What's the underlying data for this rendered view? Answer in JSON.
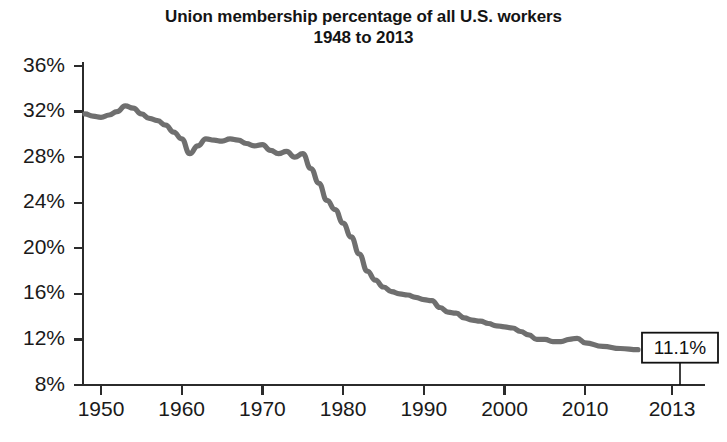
{
  "chart": {
    "title_line1": "Union membership percentage of all U.S. workers",
    "title_line2": "1948 to 2013",
    "callout_label": "11.1%",
    "line_color": "#6f6f6f",
    "axis_color": "#2b2b2b",
    "background_color": "#ffffff"
  },
  "chart_data": {
    "type": "line",
    "title": "Union membership percentage of all U.S. workers 1948 to 2013",
    "subtitle": "1948 to 2013",
    "xlabel": "",
    "ylabel": "",
    "xlim": [
      1948,
      2013
    ],
    "ylim": [
      8,
      36
    ],
    "grid": false,
    "legend": false,
    "ytick_labels": [
      "36%",
      "32%",
      "28%",
      "24%",
      "20%",
      "16%",
      "12%",
      "8%"
    ],
    "ytick_values": [
      36,
      32,
      28,
      24,
      20,
      16,
      12,
      8
    ],
    "xtick_labels": [
      "1950",
      "1960",
      "1970",
      "1980",
      "1990",
      "2000",
      "2010",
      "2013"
    ],
    "xtick_values": [
      1950,
      1960,
      1970,
      1980,
      1990,
      2000,
      2010,
      2013
    ],
    "annotations": [
      {
        "text": "11.1%",
        "x": 2013,
        "y": 11.1
      }
    ],
    "series": [
      {
        "name": "Union membership percentage",
        "x": [
          1948,
          1949,
          1950,
          1951,
          1952,
          1953,
          1954,
          1955,
          1956,
          1957,
          1958,
          1959,
          1960,
          1961,
          1962,
          1963,
          1964,
          1965,
          1966,
          1967,
          1968,
          1969,
          1970,
          1971,
          1972,
          1973,
          1974,
          1975,
          1976,
          1977,
          1978,
          1979,
          1980,
          1981,
          1982,
          1983,
          1984,
          1985,
          1986,
          1987,
          1988,
          1989,
          1990,
          1991,
          1992,
          1993,
          1994,
          1995,
          1996,
          1997,
          1998,
          1999,
          2000,
          2001,
          2002,
          2003,
          2004,
          2005,
          2006,
          2007,
          2008,
          2009,
          2010,
          2011,
          2012,
          2013
        ],
        "y": [
          31.8,
          31.6,
          31.5,
          31.7,
          32.0,
          32.5,
          32.3,
          31.8,
          31.4,
          31.2,
          30.8,
          30.2,
          29.6,
          28.3,
          29.0,
          29.6,
          29.5,
          29.4,
          29.6,
          29.5,
          29.2,
          29.0,
          29.1,
          28.6,
          28.3,
          28.5,
          28.0,
          28.3,
          27.0,
          25.7,
          24.2,
          23.4,
          22.2,
          21.0,
          19.5,
          18.0,
          17.2,
          16.6,
          16.2,
          16.0,
          15.9,
          15.7,
          15.5,
          15.4,
          14.8,
          14.4,
          14.3,
          13.9,
          13.7,
          13.6,
          13.4,
          13.2,
          13.1,
          13.0,
          12.7,
          12.4,
          12.0,
          12.0,
          11.8,
          11.8,
          12.0,
          12.1,
          11.7,
          11.4,
          11.2,
          11.1
        ]
      }
    ]
  }
}
